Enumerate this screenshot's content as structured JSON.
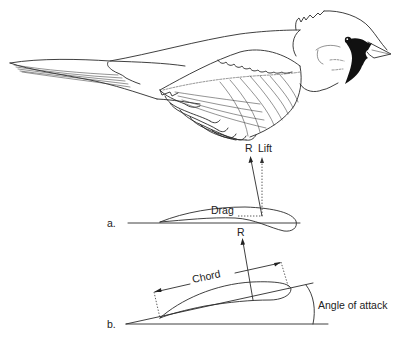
{
  "figure": {
    "diagram_a": {
      "label": "a.",
      "force_labels": {
        "resultant_top": "R",
        "lift": "Lift",
        "drag": "Drag",
        "resultant_bottom": "R"
      }
    },
    "diagram_b": {
      "label": "b.",
      "chord_label": "Chord",
      "angle_label": "Angle of attack"
    },
    "colors": {
      "ink": "#2a2a2a",
      "mask": "#111111",
      "background": "#ffffff"
    }
  }
}
